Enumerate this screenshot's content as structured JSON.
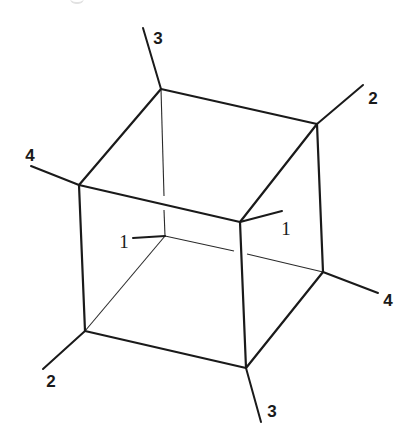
{
  "diagram": {
    "colors": {
      "line": "#1a1a1a",
      "background": "#ffffff"
    },
    "labels": [
      {
        "id": "label-3-top",
        "text": "3",
        "x": 158,
        "y": 38
      },
      {
        "id": "label-2-top-right",
        "text": "2",
        "x": 373,
        "y": 98
      },
      {
        "id": "label-4-left",
        "text": "4",
        "x": 30,
        "y": 155
      },
      {
        "id": "label-1-front",
        "text": "1",
        "x": 286,
        "y": 228
      },
      {
        "id": "label-1-back",
        "text": "1",
        "x": 124,
        "y": 241
      },
      {
        "id": "label-4-right",
        "text": "4",
        "x": 388,
        "y": 300
      },
      {
        "id": "label-2-bottom-left",
        "text": "2",
        "x": 51,
        "y": 381
      },
      {
        "id": "label-3-bottom",
        "text": "3",
        "x": 272,
        "y": 411
      }
    ]
  }
}
